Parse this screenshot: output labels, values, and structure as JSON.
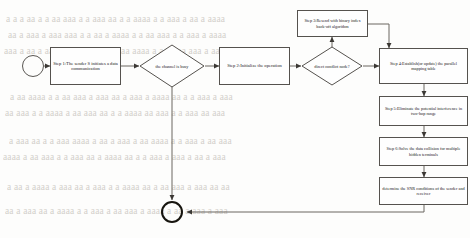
{
  "figure": {
    "kind": "flowchart",
    "title": "",
    "orientation": "left-to-right with vertical right column"
  },
  "nodes": {
    "start": {
      "name": "start",
      "shape": "circle",
      "label": ""
    },
    "step1": {
      "name": "step1",
      "shape": "rect",
      "label": "Step 1:The sender S initiates a data communication"
    },
    "decision_channel": {
      "name": "decision-channel-busy",
      "shape": "diamond",
      "label": "the channel is busy"
    },
    "step2": {
      "name": "step2",
      "shape": "rect",
      "label": "Step 2:Initialize the operation"
    },
    "decision_conflict": {
      "name": "decision-direct-conflict",
      "shape": "diamond",
      "label": "direct conflict node?"
    },
    "step3": {
      "name": "step3",
      "shape": "rect",
      "label": "Step 3:Resend with binary index back-off algorithm"
    },
    "step4": {
      "name": "step4",
      "shape": "rect",
      "label": "Step 4:Establish(or update) the parallel mapping table"
    },
    "step5": {
      "name": "step5",
      "shape": "rect",
      "label": "Step 5:Eliminate the potential interference in two-hop range"
    },
    "step6": {
      "name": "step6",
      "shape": "rect",
      "label": "Step 6:Solve the data collision for multiple hidden terminals"
    },
    "snr": {
      "name": "snr-condition",
      "shape": "rect",
      "label": "determine the SNR conditions of the sender and receiver"
    },
    "end": {
      "name": "end",
      "shape": "circle-bold",
      "label": ""
    }
  },
  "edges": [
    {
      "from": "start",
      "to": "step1",
      "label": ""
    },
    {
      "from": "step1",
      "to": "decision_channel",
      "label": ""
    },
    {
      "from": "decision_channel",
      "to": "step2",
      "label": ""
    },
    {
      "from": "decision_channel",
      "to": "end",
      "label": ""
    },
    {
      "from": "step2",
      "to": "decision_conflict",
      "label": ""
    },
    {
      "from": "decision_conflict",
      "to": "step3",
      "label": ""
    },
    {
      "from": "decision_conflict",
      "to": "step4",
      "label": ""
    },
    {
      "from": "step3",
      "to": "step4",
      "label": ""
    },
    {
      "from": "step4",
      "to": "step5",
      "label": ""
    },
    {
      "from": "step5",
      "to": "step6",
      "label": ""
    },
    {
      "from": "step6",
      "to": "snr",
      "label": ""
    },
    {
      "from": "snr",
      "to": "end",
      "label": ""
    }
  ],
  "colors": {
    "stroke": "#55524e",
    "line": "#6b6761",
    "text": "#23201d",
    "background": "#fdfdfc",
    "bleed_text": "#b9b4ad",
    "end_node": "#17150f"
  },
  "background_bleed": {
    "description": "faint show-through text from the reverse side of the scanned page",
    "lines": [
      "a a a aa  a  a aa aaa a a aaa aa  a a aaaa  a a  aaa a aa a aaaa",
      "aa a aaa  a aaa aaa a a  aa  a aaaa a a aa  aaa a  a aaa a  aaaa",
      "aaa a aa a  aaaa aa aa aaa a  a aaa aaaa a a aa  aa aaa a aa a",
      "a aa aaaa a a aa  aaa a  aaa aa  a aaa a aaaa aa  a a aaa a aaa",
      "aa aaa a a aaaa a  aa aaa aa  a a aaaa aa  aaa a a  aaa aa aaa",
      "a  aaa aa a a aaa  aaaa a aa a aaa a  aa aaaa a a  aaa a aa aaa",
      "aaaa a aa  aaa a a aaa aa a  aaaa aa a a  aaa a aaa a aa  a aaa",
      "a aa a aaaa a  aaa aa  a aaa a a aaaa aa a  aa aaa a  aaa aa aa",
      "aa a aaa aa  a aaaa a a  aaa a aa aaa a  aaaa a aa a  aaa a aaa"
    ]
  }
}
